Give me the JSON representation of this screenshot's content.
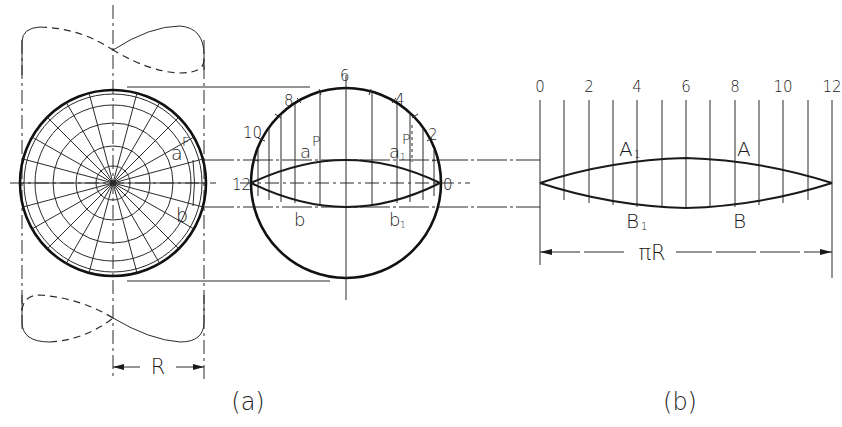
{
  "figure_a": {
    "caption": "(a)",
    "dimension_label": "R",
    "sphere_labels": {
      "a": "a",
      "F": "F",
      "b": "b"
    },
    "middle_view": {
      "division_labels": [
        "12",
        "10",
        "8",
        "6",
        "4",
        "2",
        "0"
      ],
      "point_labels": {
        "a": "a",
        "P_left": "P",
        "a1": "a",
        "a1_sub": "1",
        "P_right": "P",
        "b": "b",
        "b1": "b",
        "b1_sub": "1"
      }
    }
  },
  "figure_b": {
    "caption": "(b)",
    "scale_labels": [
      "0",
      "2",
      "4",
      "6",
      "8",
      "10",
      "12"
    ],
    "point_labels": {
      "A1": "A",
      "A1_sub": "1",
      "A": "A",
      "B1": "B",
      "B1_sub": "1",
      "B": "B"
    },
    "dimension_label": "πR"
  },
  "colors": {
    "ink": "#1a1a1a",
    "background": "#ffffff"
  }
}
